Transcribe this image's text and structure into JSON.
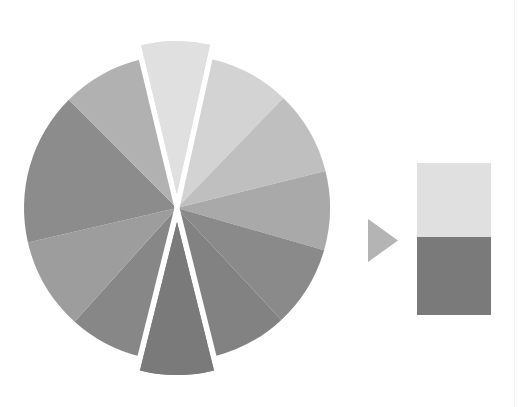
{
  "chart_data": [
    {
      "type": "pie",
      "title": "",
      "exploded_slices": [
        0,
        6
      ],
      "center": [
        177,
        208
      ],
      "radius": 153,
      "explode_offset": 14,
      "slices": [
        {
          "label": "",
          "start_deg": -103.5,
          "end_deg": -77.5,
          "color": "#e0e0e0",
          "exploded": true
        },
        {
          "label": "",
          "start_deg": -77.5,
          "end_deg": -46,
          "color": "#d3d3d3",
          "exploded": false
        },
        {
          "label": "",
          "start_deg": -46,
          "end_deg": -14,
          "color": "#bfbfbf",
          "exploded": false
        },
        {
          "label": "",
          "start_deg": -14,
          "end_deg": 16,
          "color": "#a9a9a9",
          "exploded": false
        },
        {
          "label": "",
          "start_deg": 16,
          "end_deg": 47,
          "color": "#8a8a8a",
          "exploded": false
        },
        {
          "label": "",
          "start_deg": 47,
          "end_deg": 76,
          "color": "#828282",
          "exploded": false
        },
        {
          "label": "",
          "start_deg": 76,
          "end_deg": 104,
          "color": "#7a7a7a",
          "exploded": true
        },
        {
          "label": "",
          "start_deg": 104,
          "end_deg": 132,
          "color": "#878787",
          "exploded": false
        },
        {
          "label": "",
          "start_deg": 132,
          "end_deg": 167,
          "color": "#9d9d9d",
          "exploded": false
        },
        {
          "label": "",
          "start_deg": 167,
          "end_deg": 225,
          "color": "#8c8c8c",
          "exploded": false
        },
        {
          "label": "",
          "start_deg": 225,
          "end_deg": 256.5,
          "color": "#b1b1b1",
          "exploded": false
        }
      ]
    },
    {
      "type": "bar",
      "stacked": true,
      "title": "",
      "categories": [
        ""
      ],
      "series": [
        {
          "name": "",
          "values": [
            1
          ],
          "color": "#e0e0e0"
        },
        {
          "name": "",
          "values": [
            1
          ],
          "color": "#7a7a7a"
        }
      ],
      "box": {
        "x": 417,
        "y": 163,
        "width": 74,
        "height": 152,
        "split_y": 237
      }
    }
  ],
  "arrow": {
    "icon": "triangle-right-icon",
    "color": "#b4b4b4",
    "points": "368,219 398,240.5 368,262"
  },
  "colors": {
    "background": "#ffffff",
    "gap": "#ffffff"
  }
}
